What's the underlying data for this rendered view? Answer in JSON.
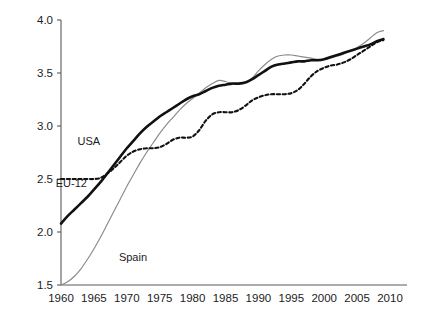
{
  "chart_data": {
    "type": "line",
    "title": "",
    "subtitle": "",
    "xlabel": "",
    "ylabel": "",
    "xlim": [
      1958,
      2012
    ],
    "ylim": [
      1.5,
      4.0
    ],
    "grid": false,
    "legend_position": "inline-annotations",
    "xticks": [
      1960,
      1965,
      1970,
      1975,
      1980,
      1985,
      1990,
      1995,
      2000,
      2005,
      2010
    ],
    "xtick_labels": [
      "1960",
      "1965",
      "1970",
      "1975",
      "1980",
      "1985",
      "1990",
      "1995",
      "2000",
      "2005",
      "2010"
    ],
    "yticks": [
      1.5,
      2.0,
      2.5,
      3.0,
      3.5,
      4.0
    ],
    "ytick_labels": [
      "1.5",
      "2.0",
      "2.5",
      "3.0",
      "3.5",
      "4.0"
    ],
    "annotations": [
      {
        "text": "USA",
        "x": 1962.5,
        "y": 2.82,
        "name": "series-label-usa"
      },
      {
        "text": "EU-12",
        "x": 1959.2,
        "y": 2.42,
        "name": "series-label-eu12"
      },
      {
        "text": "Spain",
        "x": 1968.8,
        "y": 1.73,
        "name": "series-label-spain"
      }
    ],
    "series": [
      {
        "name": "EU-12",
        "style": "solid-thick",
        "color": "#111111",
        "x": [
          1960,
          1961,
          1962,
          1963,
          1964,
          1965,
          1966,
          1967,
          1968,
          1969,
          1970,
          1971,
          1972,
          1973,
          1974,
          1975,
          1976,
          1977,
          1978,
          1979,
          1980,
          1981,
          1982,
          1983,
          1984,
          1985,
          1986,
          1987,
          1988,
          1989,
          1990,
          1991,
          1992,
          1993,
          1994,
          1995,
          1996,
          1997,
          1998,
          1999,
          2000,
          2001,
          2002,
          2003,
          2004,
          2005,
          2006,
          2007,
          2008,
          2009
        ],
        "values": [
          2.08,
          2.15,
          2.21,
          2.27,
          2.33,
          2.4,
          2.47,
          2.55,
          2.63,
          2.71,
          2.79,
          2.86,
          2.93,
          2.99,
          3.04,
          3.09,
          3.13,
          3.17,
          3.21,
          3.25,
          3.28,
          3.3,
          3.33,
          3.36,
          3.38,
          3.39,
          3.4,
          3.4,
          3.41,
          3.44,
          3.48,
          3.52,
          3.56,
          3.58,
          3.59,
          3.6,
          3.61,
          3.61,
          3.62,
          3.62,
          3.63,
          3.65,
          3.67,
          3.69,
          3.71,
          3.73,
          3.75,
          3.77,
          3.8,
          3.82
        ]
      },
      {
        "name": "USA",
        "style": "dashed",
        "color": "#111111",
        "x": [
          1960,
          1961,
          1962,
          1963,
          1964,
          1965,
          1966,
          1967,
          1968,
          1969,
          1970,
          1971,
          1972,
          1973,
          1974,
          1975,
          1976,
          1977,
          1978,
          1979,
          1980,
          1981,
          1982,
          1983,
          1984,
          1985,
          1986,
          1987,
          1988,
          1989,
          1990,
          1991,
          1992,
          1993,
          1994,
          1995,
          1996,
          1997,
          1998,
          1999,
          2000,
          2001,
          2002,
          2003,
          2004,
          2005,
          2006,
          2007,
          2008,
          2009
        ],
        "values": [
          2.5,
          2.5,
          2.5,
          2.5,
          2.5,
          2.5,
          2.51,
          2.55,
          2.6,
          2.66,
          2.72,
          2.76,
          2.78,
          2.79,
          2.79,
          2.8,
          2.83,
          2.87,
          2.89,
          2.89,
          2.9,
          2.96,
          3.05,
          3.11,
          3.13,
          3.13,
          3.13,
          3.15,
          3.19,
          3.24,
          3.27,
          3.29,
          3.3,
          3.3,
          3.3,
          3.31,
          3.34,
          3.4,
          3.47,
          3.52,
          3.55,
          3.57,
          3.58,
          3.6,
          3.63,
          3.67,
          3.71,
          3.75,
          3.79,
          3.81
        ]
      },
      {
        "name": "Spain",
        "style": "solid-thin",
        "color": "#8a8a8a",
        "x": [
          1960,
          1961,
          1962,
          1963,
          1964,
          1965,
          1966,
          1967,
          1968,
          1969,
          1970,
          1971,
          1972,
          1973,
          1974,
          1975,
          1976,
          1977,
          1978,
          1979,
          1980,
          1981,
          1982,
          1983,
          1984,
          1985,
          1986,
          1987,
          1988,
          1989,
          1990,
          1991,
          1992,
          1993,
          1994,
          1995,
          1996,
          1997,
          1998,
          1999,
          2000,
          2001,
          2002,
          2003,
          2004,
          2005,
          2006,
          2007,
          2008,
          2009
        ],
        "values": [
          1.5,
          1.53,
          1.58,
          1.65,
          1.74,
          1.84,
          1.95,
          2.07,
          2.19,
          2.31,
          2.43,
          2.54,
          2.65,
          2.75,
          2.84,
          2.93,
          3.01,
          3.08,
          3.15,
          3.21,
          3.26,
          3.31,
          3.36,
          3.4,
          3.43,
          3.42,
          3.4,
          3.4,
          3.41,
          3.45,
          3.52,
          3.58,
          3.63,
          3.66,
          3.67,
          3.67,
          3.66,
          3.65,
          3.64,
          3.63,
          3.63,
          3.64,
          3.66,
          3.68,
          3.71,
          3.74,
          3.78,
          3.83,
          3.88,
          3.9
        ]
      }
    ]
  },
  "axes_geometry": {
    "plot_left": 61,
    "plot_right": 390,
    "plot_top": 20,
    "plot_bottom": 285,
    "axis_right_end": 407
  }
}
